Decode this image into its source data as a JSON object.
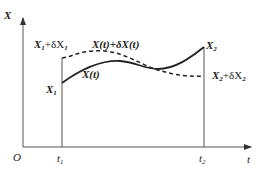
{
  "diagram": {
    "type": "variational-path-diagram",
    "axes": {
      "y_label": "X",
      "x_label": "t",
      "origin_label": "O"
    },
    "ticks": {
      "t1": {
        "base": "t",
        "sub": "1"
      },
      "t2": {
        "base": "t",
        "sub": "2"
      }
    },
    "curves": {
      "nominal": {
        "label": "X(t)",
        "style": "solid"
      },
      "varied": {
        "label": "X(t)+δX(t)",
        "style": "dashed"
      }
    },
    "endpoints": {
      "start_nominal": {
        "base": "X",
        "sub": "1"
      },
      "start_varied": {
        "base": "X",
        "sub": "1",
        "suffix": "+δX",
        "suffix_sub": "1"
      },
      "end_nominal": {
        "base": "X",
        "sub": "2"
      },
      "end_varied": {
        "base": "X",
        "sub": "2",
        "suffix": "+δX",
        "suffix_sub": "2"
      }
    },
    "colors": {
      "line": "#222222",
      "axis": "#555555",
      "background": "#ffffff"
    }
  }
}
